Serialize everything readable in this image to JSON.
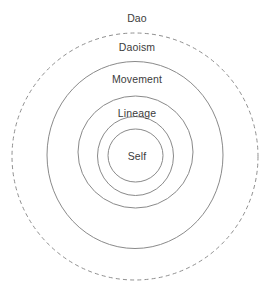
{
  "diagram": {
    "type": "concentric-circles",
    "background_color": "#ffffff",
    "stroke_color": "#8a8a8a",
    "text_color": "#3c3c3c",
    "center": {
      "x": 135,
      "y": 156
    },
    "rings": [
      {
        "id": "dao",
        "label": "Dao",
        "level": 1,
        "style": "dashed",
        "rx": 123,
        "ry": 123.5,
        "label_position": "above-top-edge"
      },
      {
        "id": "daoism",
        "label": "Daoism",
        "level": 2,
        "style": "solid",
        "rx": 88,
        "ry": 93.5,
        "label_position": "inside-top"
      },
      {
        "id": "movement",
        "label": "Movement",
        "level": 3,
        "style": "solid",
        "rx": 58,
        "ry": 62,
        "label_position": "inside-top"
      },
      {
        "id": "lineage",
        "label": "Lineage",
        "level": 4,
        "style": "solid",
        "rx": 43,
        "ry": 45,
        "label_position": "inside-top"
      },
      {
        "id": "self",
        "label": "Self",
        "level": 5,
        "style": "solid",
        "rx": 27.5,
        "ry": 26.5,
        "label_position": "center"
      }
    ]
  }
}
